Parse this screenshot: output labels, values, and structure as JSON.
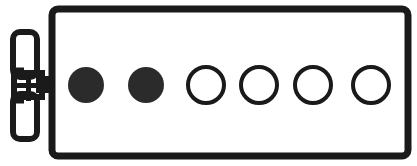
{
  "figure": {
    "kind": "technical-line-drawing",
    "canvas": {
      "width": 417,
      "height": 166
    },
    "colors": {
      "background": "#ffffff",
      "ink": "#1a1a1a",
      "fill_dark": "#2b2b2b",
      "fill_none": "none"
    },
    "plate": {
      "name": "rounded-rectangle-plate",
      "x": 52,
      "y": 9,
      "width": 356,
      "height": 147,
      "corner_radius": 6,
      "stroke_width": 7,
      "fill": "none"
    },
    "wing_nut": {
      "name": "wing-nut-fastener",
      "stroke_width": 6,
      "upper_wing": {
        "x": 13,
        "y": 32,
        "width": 24,
        "height": 45,
        "corner_radius": 7
      },
      "lower_wing": {
        "x": 13,
        "y": 94,
        "width": 24,
        "height": 45,
        "corner_radius": 7
      },
      "hub": {
        "x": 14,
        "y": 73,
        "width": 28,
        "height": 24
      },
      "shaft": {
        "x": 36,
        "y": 76,
        "width": 17,
        "height": 17
      }
    },
    "holes": {
      "count": 6,
      "radius": 18,
      "center_y": 85,
      "stroke_width": 4,
      "items": [
        {
          "index": 1,
          "label": "hole-1",
          "cx": 86,
          "cy": 85,
          "r": 18,
          "state": "filled"
        },
        {
          "index": 2,
          "label": "hole-2",
          "cx": 146,
          "cy": 85,
          "r": 18,
          "state": "filled"
        },
        {
          "index": 3,
          "label": "hole-3",
          "cx": 206,
          "cy": 85,
          "r": 18,
          "state": "open"
        },
        {
          "index": 4,
          "label": "hole-4",
          "cx": 259,
          "cy": 85,
          "r": 18,
          "state": "open"
        },
        {
          "index": 5,
          "label": "hole-5",
          "cx": 313,
          "cy": 85,
          "r": 18,
          "state": "open"
        },
        {
          "index": 6,
          "label": "hole-6",
          "cx": 371,
          "cy": 85,
          "r": 18,
          "state": "open"
        }
      ]
    }
  }
}
